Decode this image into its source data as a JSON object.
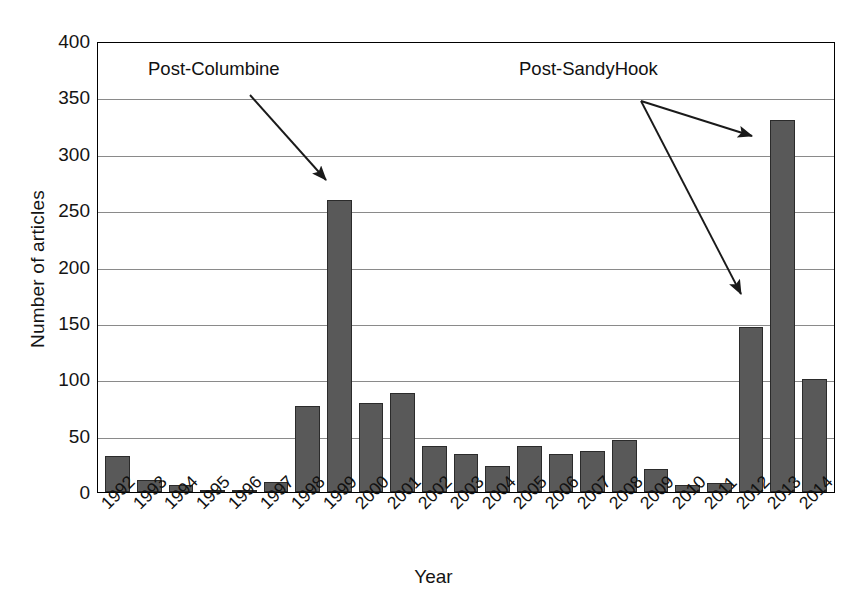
{
  "chart_data": {
    "type": "bar",
    "title": "",
    "xlabel": "Year",
    "ylabel": "Number of articles",
    "categories": [
      "1992",
      "1993",
      "1994",
      "1995",
      "1996",
      "1997",
      "1998",
      "1999",
      "2000",
      "2001",
      "2002",
      "2003",
      "2004",
      "2005",
      "2006",
      "2007",
      "2008",
      "2009",
      "2010",
      "2011",
      "2012",
      "2013",
      "2014"
    ],
    "values": [
      32,
      11,
      6,
      1,
      1,
      9,
      76,
      259,
      79,
      88,
      41,
      34,
      23,
      41,
      34,
      36,
      46,
      20,
      6,
      8,
      146,
      330,
      100
    ],
    "ylim": [
      0,
      400
    ],
    "y_ticks": [
      0,
      50,
      100,
      150,
      200,
      250,
      300,
      350,
      400
    ],
    "grid": true,
    "legend": "none",
    "bar_color": "#595959",
    "bar_edge_color": "#2b2b2b",
    "annotations": [
      {
        "id": "post-columbine",
        "text": "Post-Columbine",
        "points_to_category": "1999",
        "points_to_value": 259
      },
      {
        "id": "post-sandyhook",
        "text": "Post-SandyHook",
        "points_to_categories": [
          "2013",
          "2012"
        ],
        "points_to_values": [
          330,
          146
        ]
      }
    ]
  },
  "axis": {
    "y_title": "Number of articles",
    "x_title": "Year"
  },
  "annotations": {
    "columbine_label": "Post-Columbine",
    "sandyhook_label": "Post-SandyHook"
  }
}
